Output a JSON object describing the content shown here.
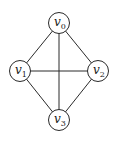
{
  "diagram": {
    "type": "graph",
    "nodes": [
      {
        "id": "v0",
        "label": "v",
        "subscript": "0"
      },
      {
        "id": "v1",
        "label": "v",
        "subscript": "1"
      },
      {
        "id": "v2",
        "label": "v",
        "subscript": "2"
      },
      {
        "id": "v3",
        "label": "v",
        "subscript": "3"
      }
    ],
    "edges": [
      {
        "from": "v0",
        "to": "v1"
      },
      {
        "from": "v0",
        "to": "v2"
      },
      {
        "from": "v0",
        "to": "v3"
      },
      {
        "from": "v1",
        "to": "v2"
      },
      {
        "from": "v1",
        "to": "v3"
      },
      {
        "from": "v2",
        "to": "v3"
      }
    ]
  }
}
